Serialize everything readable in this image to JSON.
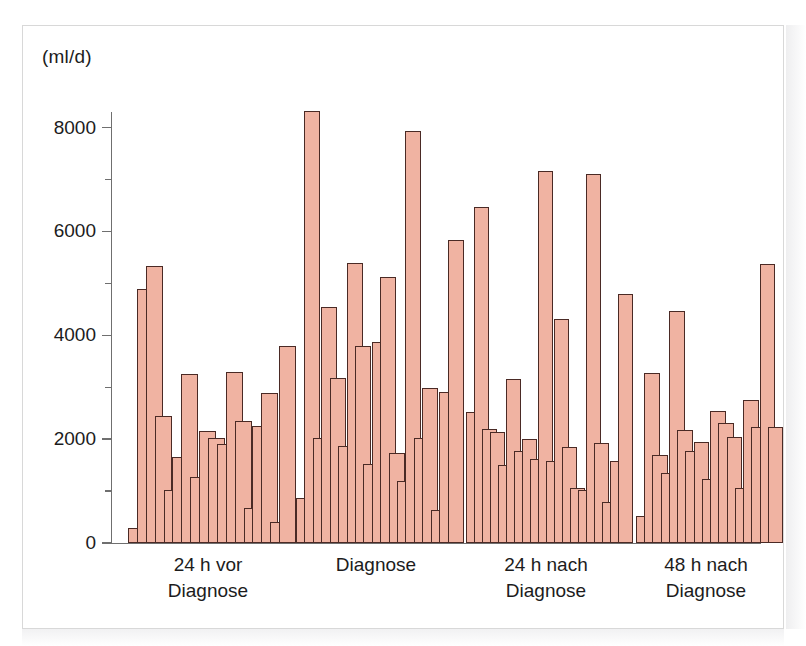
{
  "figure": {
    "unit_label": "(ml/d)",
    "bar_fill_color": "#f0b3a2",
    "bar_stroke_color": "#4a2a25",
    "axis_color": "#6f6f6f",
    "frame_color": "#d8d8d8"
  },
  "chart_data": {
    "type": "bar",
    "title": "",
    "subtitle": "",
    "xlabel": "",
    "ylabel": "(ml/d)",
    "ylim": [
      0,
      8300
    ],
    "grid": false,
    "legend": null,
    "y_major_ticks": [
      0,
      2000,
      4000,
      6000,
      8000
    ],
    "y_minor_ticks": [
      1000,
      3000,
      5000,
      7000
    ],
    "y_tick_labels": [
      "0",
      "2000",
      "4000",
      "6000",
      "8000"
    ],
    "categories": [
      "24 h vor Diagnose",
      "Diagnose",
      "24 h nach Diagnose",
      "48 h nach Diagnose"
    ],
    "category_lines": [
      [
        "24 h vor",
        "Diagnose"
      ],
      [
        "Diagnose",
        ""
      ],
      [
        "24 h nach",
        "Diagnose"
      ],
      [
        "48 h nach",
        "Diagnose"
      ]
    ],
    "note": "Each category contains one overlapping bar per patient; values are individual urine output readings in ml/d.",
    "groups": [
      {
        "label": "24 h vor Diagnose",
        "values": [
          280,
          4900,
          5340,
          2450,
          1020,
          1650,
          3260,
          1280,
          2150,
          2030,
          1900,
          3300,
          2350,
          680,
          2250,
          2880,
          410,
          3790
        ]
      },
      {
        "label": "Diagnose",
        "values": [
          870,
          8320,
          2030,
          4540,
          3180,
          1870,
          5400,
          3790,
          1520,
          3880,
          5120,
          1730,
          1200,
          7930,
          2020,
          2990,
          630,
          2900,
          5830
        ]
      },
      {
        "label": "24 h nach Diagnose",
        "values": [
          2520,
          6480,
          2200,
          2130,
          1500,
          3160,
          1780,
          2000,
          1620,
          7160,
          1580,
          4320,
          1840,
          1060,
          1020,
          7100,
          1930,
          780,
          1580,
          4790
        ]
      },
      {
        "label": "48 h nach Diagnose",
        "values": [
          520,
          3280,
          1690,
          1350,
          4470,
          2180,
          1780,
          1950,
          1230,
          2550,
          2320,
          2050,
          1060,
          2750,
          2230,
          5370,
          2240
        ]
      }
    ]
  }
}
